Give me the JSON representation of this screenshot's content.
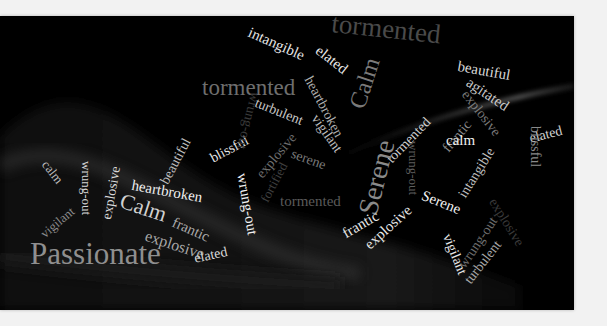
{
  "wordcloud": {
    "background_color": "#000000",
    "words": [
      {
        "text": "tormented",
        "color": "#4a4a4a"
      },
      {
        "text": "intangible",
        "color": "#e6e6e6"
      },
      {
        "text": "elated",
        "color": "#e6e6e6"
      },
      {
        "text": "Calm",
        "color": "#7a7a7a"
      },
      {
        "text": "beautiful",
        "color": "#d8d8d8"
      },
      {
        "text": "agitated",
        "color": "#c8c8c8"
      },
      {
        "text": "tormented",
        "color": "#6e6e6e"
      },
      {
        "text": "heartbroken",
        "color": "#b0b0b0"
      },
      {
        "text": "turbulent",
        "color": "#c8c8c8"
      },
      {
        "text": "vigilant",
        "color": "#bdbdbd"
      },
      {
        "text": "explosive",
        "color": "#7a7a7a"
      },
      {
        "text": "frantic",
        "color": "#8a8a8a"
      },
      {
        "text": "tormented",
        "color": "#d0d0d0"
      },
      {
        "text": "elated",
        "color": "#d0d0d0"
      },
      {
        "text": "Serene",
        "color": "#8a8a8a"
      },
      {
        "text": "calm",
        "color": "#f0f0f0"
      },
      {
        "text": "blissful",
        "color": "#8a8a8a"
      },
      {
        "text": "beautiful",
        "color": "#bdbdbd"
      },
      {
        "text": "blissful",
        "color": "#e6e6e6"
      },
      {
        "text": "wrung-out",
        "color": "#3a3a3a"
      },
      {
        "text": "explosive",
        "color": "#6e6e6e"
      },
      {
        "text": "fortified",
        "color": "#3e3e3e"
      },
      {
        "text": "serene",
        "color": "#7a7a7a"
      },
      {
        "text": "wrung-out",
        "color": "#5e5e5e"
      },
      {
        "text": "intangible",
        "color": "#bdbdbd"
      },
      {
        "text": "calm",
        "color": "#bdbdbd"
      },
      {
        "text": "wrung-out",
        "color": "#d8d8d8"
      },
      {
        "text": "explosive",
        "color": "#d8d8d8"
      },
      {
        "text": "vigilant",
        "color": "#8a8a8a"
      },
      {
        "text": "heartbroken",
        "color": "#f0f0f0"
      },
      {
        "text": "Calm",
        "color": "#d0d0d0"
      },
      {
        "text": "tormented",
        "color": "#5a5a5a"
      },
      {
        "text": "frantic",
        "color": "#e6e6e6"
      },
      {
        "text": "explosive",
        "color": "#e6e6e6"
      },
      {
        "text": "Serene",
        "color": "#f0f0f0"
      },
      {
        "text": "vigilant",
        "color": "#e6e6e6"
      },
      {
        "text": "wrung-out",
        "color": "#6e6e6e"
      },
      {
        "text": "turbulent",
        "color": "#a8a8a8"
      },
      {
        "text": "explosive",
        "color": "#3a3a3a"
      },
      {
        "text": "frantic",
        "color": "#a8a8a8"
      },
      {
        "text": "explosive",
        "color": "#a8a8a8"
      },
      {
        "text": "wrung-out",
        "color": "#f0f0f0"
      },
      {
        "text": "Passionate",
        "color": "#8f8f8f"
      },
      {
        "text": "elated",
        "color": "#d8d8d8"
      }
    ]
  }
}
